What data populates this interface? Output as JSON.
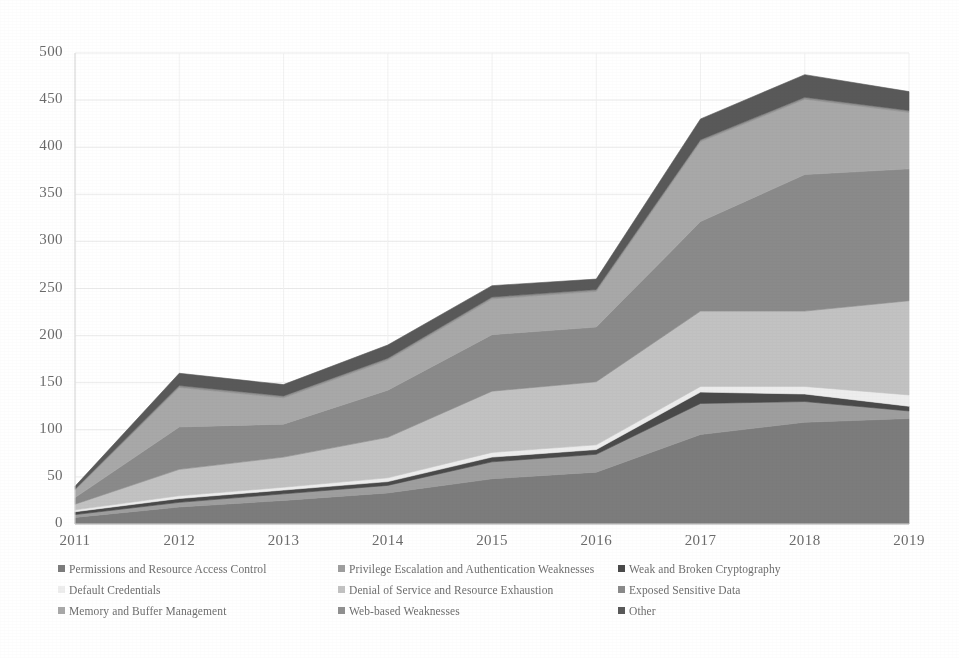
{
  "chart_data": {
    "type": "area",
    "stacked": true,
    "title": "",
    "subtitle": "",
    "xlabel": "",
    "ylabel": "",
    "categories": [
      "2011",
      "2012",
      "2013",
      "2014",
      "2015",
      "2016",
      "2017",
      "2018",
      "2019"
    ],
    "x": [
      2011,
      2012,
      2013,
      2014,
      2015,
      2016,
      2017,
      2018,
      2019
    ],
    "ylim": [
      0,
      500
    ],
    "xlim": [
      2011,
      2019
    ],
    "yticks": [
      0,
      50,
      100,
      150,
      200,
      250,
      300,
      350,
      400,
      450,
      500
    ],
    "ytick_labels": [
      "0",
      "50",
      "100",
      "150",
      "200",
      "250",
      "300",
      "350",
      "400",
      "450",
      "500"
    ],
    "grid": true,
    "legend_position": "bottom",
    "legend_columns": 3,
    "series": [
      {
        "name": "Permissions and Resource Access Control",
        "color": "#7c7c7c",
        "values": [
          7,
          18,
          25,
          33,
          48,
          55,
          95,
          108,
          112
        ]
      },
      {
        "name": "Privilege Escalation and Authentication Weaknesses",
        "color": "#9e9e9e",
        "values": [
          3,
          5,
          7,
          8,
          18,
          19,
          33,
          22,
          8
        ]
      },
      {
        "name": "Weak and Broken Cryptography",
        "color": "#4a4a4a",
        "values": [
          3,
          4,
          4,
          4,
          5,
          5,
          12,
          8,
          5
        ]
      },
      {
        "name": "Default Credentials",
        "color": "#ededed",
        "values": [
          2,
          3,
          3,
          4,
          5,
          5,
          6,
          8,
          12
        ]
      },
      {
        "name": "Denial of Service and Resource Exhaustion",
        "color": "#c2c2c2",
        "values": [
          6,
          28,
          32,
          43,
          65,
          67,
          80,
          80,
          100
        ]
      },
      {
        "name": "Exposed Sensitive Data",
        "color": "#8a8a8a",
        "values": [
          7,
          45,
          35,
          50,
          60,
          58,
          95,
          145,
          140
        ]
      },
      {
        "name": "Memory and Buffer Management",
        "color": "#a8a8a8",
        "values": [
          8,
          42,
          28,
          32,
          38,
          38,
          85,
          80,
          60
        ]
      },
      {
        "name": "Web-based Weaknesses",
        "color": "#909090",
        "values": [
          1,
          2,
          2,
          2,
          2,
          2,
          2,
          2,
          2
        ]
      },
      {
        "name": "Other",
        "color": "#595959",
        "values": [
          3,
          13,
          12,
          14,
          12,
          11,
          22,
          24,
          20
        ]
      }
    ],
    "totals": [
      40,
      160,
      148,
      190,
      253,
      260,
      430,
      477,
      459
    ]
  },
  "axes": {
    "y_tick_labels": [
      "500",
      "450",
      "400",
      "350",
      "300",
      "250",
      "200",
      "150",
      "100",
      "50",
      "0"
    ],
    "x_tick_labels": [
      "2011",
      "2012",
      "2013",
      "2014",
      "2015",
      "2016",
      "2017",
      "2018",
      "2019"
    ]
  },
  "legend": {
    "items": [
      {
        "label": "Permissions and Resource Access Control",
        "color": "#7c7c7c"
      },
      {
        "label": "Privilege Escalation and Authentication Weaknesses",
        "color": "#9e9e9e"
      },
      {
        "label": "Weak and Broken Cryptography",
        "color": "#4a4a4a"
      },
      {
        "label": "Default Credentials",
        "color": "#ededed"
      },
      {
        "label": "Denial of Service and Resource Exhaustion",
        "color": "#c2c2c2"
      },
      {
        "label": "Exposed Sensitive Data",
        "color": "#8a8a8a"
      },
      {
        "label": "Memory and Buffer Management",
        "color": "#a8a8a8"
      },
      {
        "label": "Web-based Weaknesses",
        "color": "#909090"
      },
      {
        "label": "Other",
        "color": "#595959"
      }
    ]
  },
  "style": {
    "plot_background": "#ffffff",
    "gridline_color": "#e9e9e9",
    "axis_text_color": "#6b6b6b",
    "page_background": "#ffffff"
  }
}
